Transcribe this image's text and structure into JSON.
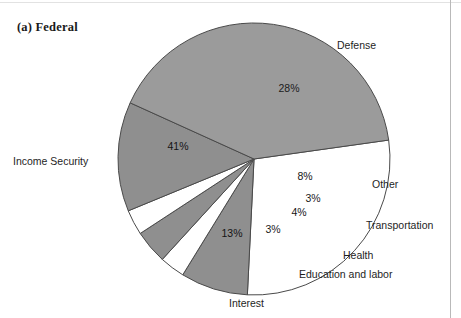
{
  "figure": {
    "title": "(a) Federal",
    "width": 461,
    "height": 318
  },
  "chart_data": {
    "type": "pie",
    "title": "(a) Federal",
    "subtitle": "",
    "xlabel": "",
    "ylabel": "",
    "grid": false,
    "legend_position": "outside-callout-labels",
    "total_label": "100%",
    "start_angle_deg": -8,
    "direction": "clockwise",
    "center": {
      "x": 254,
      "y": 159
    },
    "radius": 136,
    "categories": [
      "Defense",
      "Other",
      "Transportation",
      "Health",
      "Education and labor",
      "Interest",
      "Income Security"
    ],
    "values": [
      28,
      8,
      3,
      4,
      3,
      13,
      41
    ],
    "value_labels": [
      "28%",
      "8%",
      "3%",
      "4%",
      "3%",
      "13%",
      "41%"
    ],
    "colors": [
      "#ffffff",
      "#8f8f8f",
      "#ffffff",
      "#8f8f8f",
      "#ffffff",
      "#8f8f8f",
      "#9b9b9b"
    ],
    "slices": [
      {
        "name": "Defense",
        "value": 28,
        "value_label": "28%",
        "fill": "#ffffff",
        "start_deg": -8,
        "end_deg": 92.8,
        "label_pos": {
          "x": 289,
          "y": 89
        },
        "callout": {
          "text": "Defense",
          "x": 337,
          "y": 39
        }
      },
      {
        "name": "Other",
        "value": 8,
        "value_label": "8%",
        "fill": "#8f8f8f",
        "start_deg": 92.8,
        "end_deg": 121.6,
        "label_pos": {
          "x": 305,
          "y": 177
        },
        "callout": {
          "text": "Other",
          "x": 372,
          "y": 178
        }
      },
      {
        "name": "Transportation",
        "value": 3,
        "value_label": "3%",
        "fill": "#ffffff",
        "start_deg": 121.6,
        "end_deg": 132.4,
        "label_pos": {
          "x": 313,
          "y": 199
        },
        "callout": {
          "text": "Transportation",
          "x": 366,
          "y": 219
        }
      },
      {
        "name": "Health",
        "value": 4,
        "value_label": "4%",
        "fill": "#8f8f8f",
        "start_deg": 132.4,
        "end_deg": 146.8,
        "label_pos": {
          "x": 299,
          "y": 213
        },
        "callout": {
          "text": "Health",
          "x": 343,
          "y": 249
        }
      },
      {
        "name": "Education and labor",
        "value": 3,
        "value_label": "3%",
        "fill": "#ffffff",
        "start_deg": 146.8,
        "end_deg": 157.6,
        "label_pos": {
          "x": 273,
          "y": 230
        },
        "callout": {
          "text": "Education and labor",
          "x": 299,
          "y": 268
        }
      },
      {
        "name": "Interest",
        "value": 13,
        "value_label": "13%",
        "fill": "#8f8f8f",
        "start_deg": 157.6,
        "end_deg": 204.4,
        "label_pos": {
          "x": 232,
          "y": 234
        },
        "callout": {
          "text": "Interest",
          "x": 229,
          "y": 297
        }
      },
      {
        "name": "Income Security",
        "value": 41,
        "value_label": "41%",
        "fill": "#9b9b9b",
        "start_deg": 204.4,
        "end_deg": 352,
        "label_pos": {
          "x": 178,
          "y": 147
        },
        "callout": {
          "text": "Income Security",
          "x": 13,
          "y": 155
        }
      }
    ],
    "colors_meta": {
      "white_slice": "#ffffff",
      "gray_slice": "#8f8f8f",
      "large_gray_slice": "#9b9b9b",
      "outline": "#4a4a4a",
      "text": "#1b1b1b"
    }
  }
}
